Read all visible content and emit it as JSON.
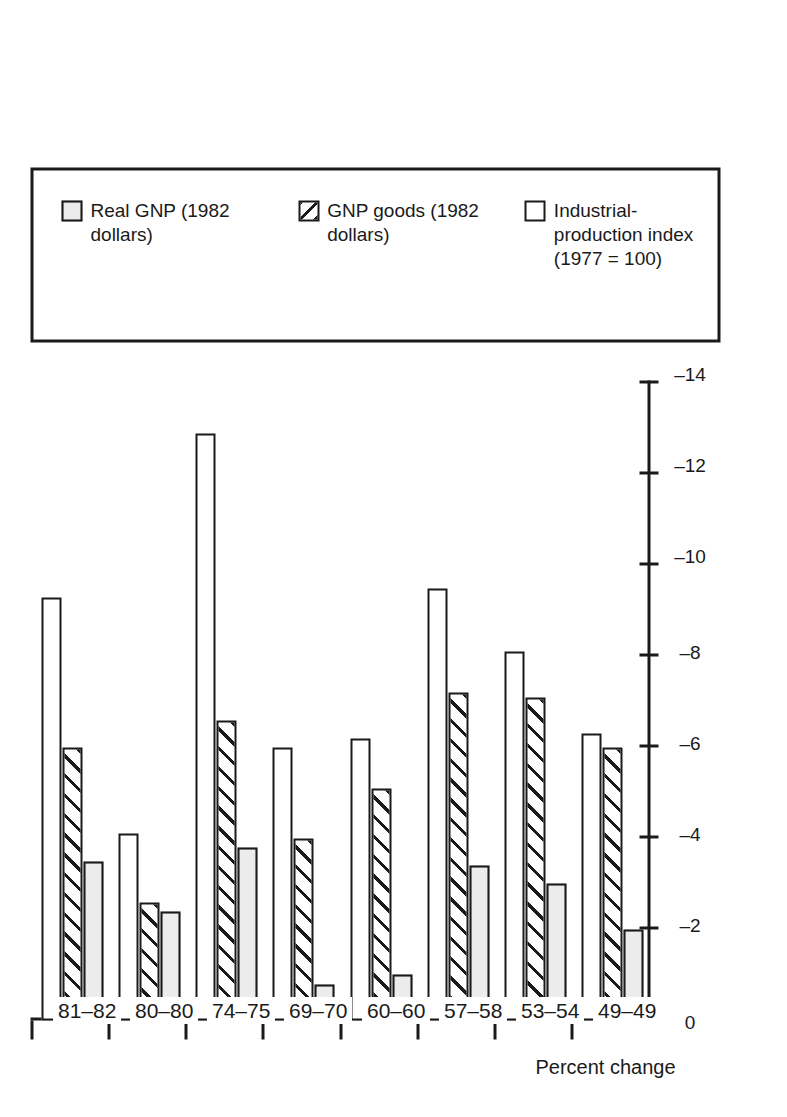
{
  "figure": {
    "value_axis_title": "Percent change"
  },
  "legend": {
    "items": [
      {
        "key": "real-gnp",
        "label": "Real GNP (1982 dollars)"
      },
      {
        "key": "gnp-goods",
        "label": "GNP goods (1982 dollars)"
      },
      {
        "key": "ind-prod",
        "label": "Industrial-production index (1977 = 100)"
      }
    ]
  },
  "chart_data": {
    "type": "bar",
    "title": "",
    "xlabel": "",
    "ylabel": "Percent change",
    "orientation": "horizontal",
    "grid": false,
    "legend_position": "right",
    "categories": [
      "49–49",
      "53–54",
      "57–58",
      "60–60",
      "69–70",
      "74–75",
      "80–80",
      "81–82"
    ],
    "ylim": [
      -14,
      0
    ],
    "tick_labels": [
      "0",
      "–2",
      "–4",
      "–6",
      "–8",
      "–10",
      "–12",
      "–14"
    ],
    "tick_values": [
      0,
      -2,
      -4,
      -6,
      -8,
      -10,
      -12,
      -14
    ],
    "series": [
      {
        "name": "Real GNP (1982 dollars)",
        "key": "real-gnp",
        "values": [
          -2.0,
          -3.0,
          -3.4,
          -1.0,
          -0.8,
          -3.8,
          -2.4,
          -3.5
        ]
      },
      {
        "name": "GNP goods (1982 dollars)",
        "key": "gnp-goods",
        "values": [
          -6.0,
          -7.1,
          -7.2,
          -5.1,
          -4.0,
          -6.6,
          -2.6,
          -6.0
        ]
      },
      {
        "name": "Industrial-production index (1977 = 100)",
        "key": "ind-prod",
        "values": [
          -6.3,
          -8.1,
          -9.5,
          -6.2,
          -6.0,
          -12.9,
          -4.1,
          -9.3
        ]
      }
    ]
  }
}
